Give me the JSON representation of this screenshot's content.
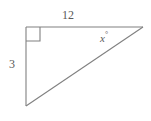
{
  "figure": {
    "kind": "right-triangle-diagram",
    "background_color": "#ffffff",
    "stroke_color": "#808080",
    "text_color": "#5a5a5a",
    "labels": {
      "top_side": "12",
      "left_side": "3",
      "angle_value": "x",
      "angle_degree_symbol": "°"
    },
    "geometry": {
      "vertex_top_left": "26,27",
      "vertex_top_right": "143,27",
      "vertex_bottom_left": "26,106",
      "right_angle_marker_size": "14"
    }
  }
}
